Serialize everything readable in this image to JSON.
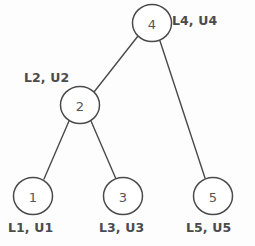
{
  "diagram": {
    "type": "binary-tree",
    "background_color": "#fdfdfd",
    "stroke_color": "#4a4a4a",
    "text_color": "#4b4b4b",
    "nodes": [
      {
        "id": "4",
        "value": "4",
        "cx": 152,
        "cy": 23,
        "r": 19,
        "annotation": "L4, U4"
      },
      {
        "id": "2",
        "value": "2",
        "cx": 80,
        "cy": 105,
        "r": 19,
        "annotation": "L2, U2"
      },
      {
        "id": "1",
        "value": "1",
        "cx": 33,
        "cy": 196,
        "r": 19,
        "annotation": "L1, U1"
      },
      {
        "id": "3",
        "value": "3",
        "cx": 123,
        "cy": 196,
        "r": 19,
        "annotation": "L3, U3"
      },
      {
        "id": "5",
        "value": "5",
        "cx": 213,
        "cy": 196,
        "r": 19,
        "annotation": "L5, U5"
      }
    ],
    "edges": [
      {
        "from": "4",
        "to": "2"
      },
      {
        "from": "4",
        "to": "5"
      },
      {
        "from": "2",
        "to": "1"
      },
      {
        "from": "2",
        "to": "3"
      }
    ]
  }
}
